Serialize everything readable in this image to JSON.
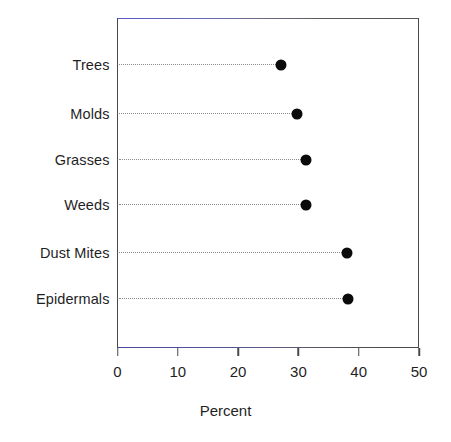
{
  "chart_data": {
    "type": "scatter",
    "variant": "dot-plot",
    "title": "",
    "xlabel": "Percent",
    "ylabel": "",
    "xlim": [
      0,
      50
    ],
    "xticks": [
      "0",
      "10",
      "20",
      "30",
      "40",
      "50"
    ],
    "grid": false,
    "legend": null,
    "orientation": "horizontal",
    "categories": [
      "Trees",
      "Molds",
      "Grasses",
      "Weeds",
      "Dust Mites",
      "Epidermals"
    ],
    "values": [
      27.1,
      29.8,
      31.3,
      31.3,
      38.1,
      38.2
    ],
    "points": [
      {
        "category": "Trees",
        "value": 27.1
      },
      {
        "category": "Molds",
        "value": 29.8
      },
      {
        "category": "Grasses",
        "value": 31.3
      },
      {
        "category": "Weeds",
        "value": 31.3
      },
      {
        "category": "Dust Mites",
        "value": 38.1
      },
      {
        "category": "Epidermals",
        "value": 38.2
      }
    ],
    "marker": {
      "shape": "circle",
      "color": "#0b0b0b",
      "size_px": 11
    },
    "leader_line": {
      "style": "dotted",
      "color": "#8a8a8a"
    },
    "frame_color": "#4a4a4a",
    "background": "#ffffff"
  }
}
